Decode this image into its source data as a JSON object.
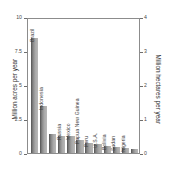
{
  "chart_data": {
    "type": "bar",
    "title": "",
    "xlabel": "",
    "ylabel": "Million acres per year",
    "ylabel_secondary": "Million hectares per year",
    "ylim": [
      0,
      10
    ],
    "ylim_secondary": [
      0,
      4
    ],
    "grid": false,
    "legend": "none",
    "bar_color": "#9a9a9a",
    "bar_edge_color": "#5e5e5e",
    "frame_color": "#8c8c8c",
    "yticks_left": [
      "0",
      "2.5",
      "5",
      "7.5",
      "10"
    ],
    "ytick_values_left": [
      0,
      2.5,
      5,
      7.5,
      10
    ],
    "yticks_right": [
      "0",
      "1",
      "2",
      "3",
      "4"
    ],
    "ytick_values_right": [
      0,
      1,
      2,
      3,
      4
    ],
    "categories": [
      "Brazil",
      "Indonesia",
      "",
      "Russia",
      "Mexico",
      "Papua New Guinea",
      "Peru",
      "U.S.A.",
      "Bolivia",
      "Sudan",
      "Nigeria",
      ""
    ],
    "values": [
      8.6,
      3.5,
      1.45,
      1.3,
      1.25,
      1.0,
      0.75,
      0.7,
      0.55,
      0.45,
      0.4,
      0.3
    ],
    "bars": [
      {
        "label": "Brazil",
        "value": 8.6
      },
      {
        "label": "Indonesia",
        "value": 3.5
      },
      {
        "label": "",
        "value": 1.45
      },
      {
        "label": "Russia",
        "value": 1.3
      },
      {
        "label": "Mexico",
        "value": 1.25
      },
      {
        "label": "Papua New Guinea",
        "value": 1.0
      },
      {
        "label": "Peru",
        "value": 0.75
      },
      {
        "label": "U.S.A.",
        "value": 0.7
      },
      {
        "label": "Bolivia",
        "value": 0.55
      },
      {
        "label": "Sudan",
        "value": 0.45
      },
      {
        "label": "Nigeria",
        "value": 0.4
      },
      {
        "label": "",
        "value": 0.3
      }
    ]
  }
}
